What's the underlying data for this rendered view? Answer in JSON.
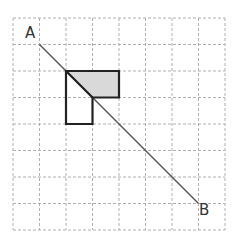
{
  "diagram": {
    "grid": {
      "cols": 8,
      "rows": 8,
      "x0": 13,
      "y0": 18,
      "cell": 26.5,
      "line_color": "#b0b0b0"
    },
    "line_AB": {
      "from": [
        1,
        1
      ],
      "to": [
        7,
        7
      ],
      "color": "#555555"
    },
    "labels": {
      "A": "A",
      "B": "B"
    },
    "shape_outline": [
      [
        2,
        2
      ],
      [
        4,
        2
      ],
      [
        4,
        3
      ],
      [
        3,
        3
      ],
      [
        3,
        4
      ],
      [
        2,
        4
      ]
    ],
    "shaded_region": [
      [
        2,
        2
      ],
      [
        4,
        2
      ],
      [
        4,
        3
      ],
      [
        3,
        3
      ]
    ],
    "shade_color": "#d9d9d9",
    "outline_color": "#222222"
  }
}
